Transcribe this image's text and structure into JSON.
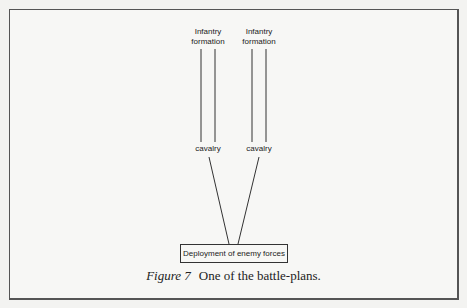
{
  "figure": {
    "nodes": {
      "infantry_left": "Infantry\nformation",
      "infantry_left_line1": "Infantry",
      "infantry_left_line2": "formation",
      "infantry_right_line1": "Infantry",
      "infantry_right_line2": "formation",
      "cavalry_left": "cavalry",
      "cavalry_right": "cavalry",
      "enemy_box": "Deployment of enemy forces"
    },
    "caption": {
      "label": "Figure 7",
      "text": "One of the battle-plans."
    },
    "colors": {
      "line": "#333333",
      "frame": "#555555",
      "background": "#f7f7f5"
    }
  }
}
